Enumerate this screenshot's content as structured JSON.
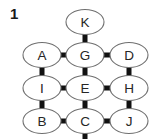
{
  "figure": {
    "label": "1",
    "width": 153,
    "height": 139,
    "background": "#ffffff",
    "edge_color": "#111111",
    "node_fill": "#ffffff",
    "node_stroke": "#6f6f6f",
    "label_color": "#262626"
  },
  "graph": {
    "node_rx": 19,
    "node_ry": 12.5,
    "nodes": [
      {
        "id": "K",
        "label": "K",
        "cx": 85,
        "cy": 22
      },
      {
        "id": "A",
        "label": "A",
        "cx": 42,
        "cy": 55
      },
      {
        "id": "G",
        "label": "G",
        "cx": 85,
        "cy": 55
      },
      {
        "id": "D",
        "label": "D",
        "cx": 129,
        "cy": 55
      },
      {
        "id": "I",
        "label": "I",
        "cx": 42,
        "cy": 88
      },
      {
        "id": "E",
        "label": "E",
        "cx": 85,
        "cy": 88
      },
      {
        "id": "H",
        "label": "H",
        "cx": 129,
        "cy": 88
      },
      {
        "id": "B",
        "label": "B",
        "cx": 42,
        "cy": 121
      },
      {
        "id": "C",
        "label": "C",
        "cx": 85,
        "cy": 121
      },
      {
        "id": "J",
        "label": "J",
        "cx": 129,
        "cy": 121
      }
    ],
    "edges": [
      {
        "from": "K",
        "to": "G",
        "orientation": "vertical",
        "x": 85,
        "y1": 32,
        "y2": 45,
        "thickness": 5
      },
      {
        "from": "A",
        "to": "G",
        "orientation": "horizontal",
        "y": 55,
        "x1": 58,
        "x2": 68,
        "thickness": 5
      },
      {
        "from": "G",
        "to": "D",
        "orientation": "horizontal",
        "y": 55,
        "x1": 102,
        "x2": 112,
        "thickness": 5
      },
      {
        "from": "A",
        "to": "I",
        "orientation": "vertical",
        "x": 42,
        "y1": 65,
        "y2": 78,
        "thickness": 5
      },
      {
        "from": "G",
        "to": "E",
        "orientation": "vertical",
        "x": 85,
        "y1": 65,
        "y2": 78,
        "thickness": 5
      },
      {
        "from": "D",
        "to": "H",
        "orientation": "vertical",
        "x": 129,
        "y1": 65,
        "y2": 78,
        "thickness": 5
      },
      {
        "from": "I",
        "to": "E",
        "orientation": "horizontal",
        "y": 88,
        "x1": 58,
        "x2": 68,
        "thickness": 5
      },
      {
        "from": "E",
        "to": "H",
        "orientation": "horizontal",
        "y": 88,
        "x1": 102,
        "x2": 112,
        "thickness": 5
      },
      {
        "from": "I",
        "to": "B",
        "orientation": "vertical",
        "x": 42,
        "y1": 98,
        "y2": 111,
        "thickness": 5
      },
      {
        "from": "E",
        "to": "C",
        "orientation": "vertical",
        "x": 85,
        "y1": 98,
        "y2": 111,
        "thickness": 5
      },
      {
        "from": "H",
        "to": "J",
        "orientation": "vertical",
        "x": 129,
        "y1": 98,
        "y2": 111,
        "thickness": 5
      },
      {
        "from": "B",
        "to": "C",
        "orientation": "horizontal",
        "y": 121,
        "x1": 58,
        "x2": 68,
        "thickness": 5
      },
      {
        "from": "C",
        "to": "J",
        "orientation": "horizontal",
        "y": 121,
        "x1": 102,
        "x2": 112,
        "thickness": 5
      },
      {
        "from": "C",
        "to": "",
        "orientation": "vertical",
        "x": 85,
        "y1": 131,
        "y2": 139,
        "thickness": 5
      }
    ]
  }
}
